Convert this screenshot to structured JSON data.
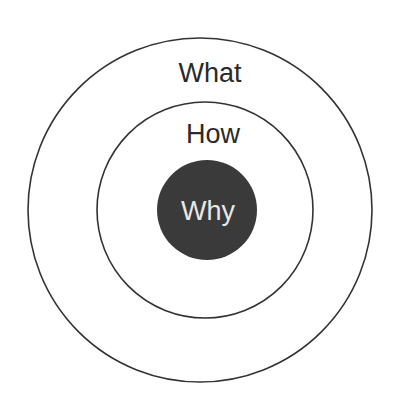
{
  "diagram": {
    "type": "concentric-circles",
    "rings": [
      {
        "id": "outer",
        "label": "What",
        "fill": "#ffffff",
        "stroke": "#333333",
        "text_color": "#2a2a2a"
      },
      {
        "id": "middle",
        "label": "How",
        "fill": "#ffffff",
        "stroke": "#333333",
        "text_color": "#2a2a2a"
      },
      {
        "id": "core",
        "label": "Why",
        "fill": "#3a3a3a",
        "stroke": "#3a3a3a",
        "text_color": "#e8e8e8"
      }
    ]
  }
}
